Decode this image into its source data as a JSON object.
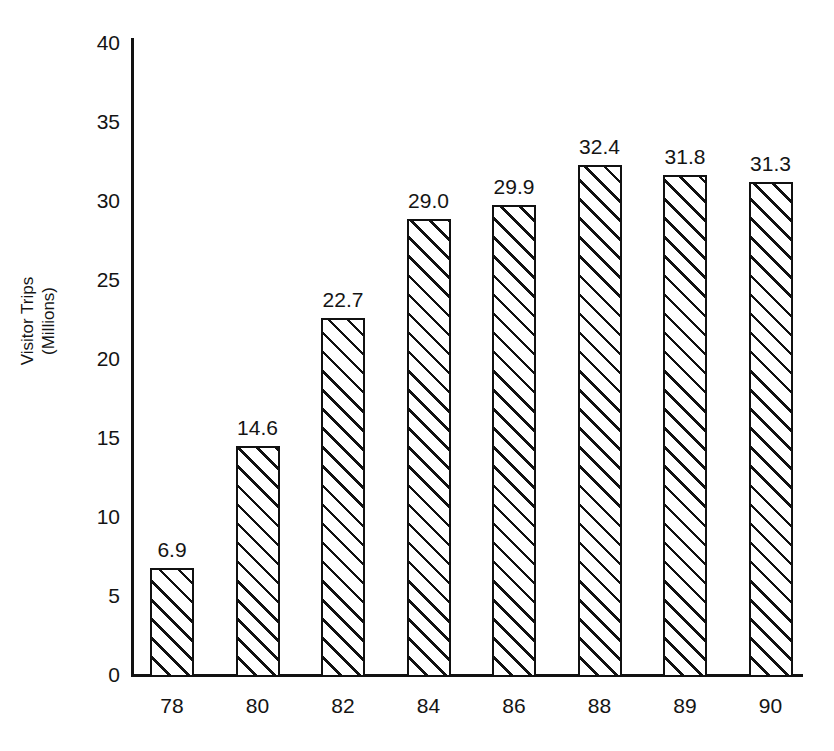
{
  "chart_data": {
    "type": "bar",
    "title": "",
    "title_note": "clipped at top edge of image, illegible",
    "xlabel": "",
    "ylabel_line1": "Visitor Trips",
    "ylabel_line2": "(Millions)",
    "ylabel": "Visitor Trips (Millions)",
    "categories": [
      "78",
      "80",
      "82",
      "84",
      "86",
      "88",
      "89",
      "90"
    ],
    "values": [
      6.9,
      14.6,
      22.7,
      29.0,
      29.9,
      32.4,
      31.8,
      31.3
    ],
    "data_labels": [
      "6.9",
      "14.6",
      "22.7",
      "29.0",
      "29.9",
      "32.4",
      "31.8",
      "31.3"
    ],
    "ylim": [
      0,
      40
    ],
    "yticks": [
      0,
      5,
      10,
      15,
      20,
      25,
      30,
      35,
      40
    ],
    "ytick_labels": [
      "0",
      "5",
      "10",
      "15",
      "20",
      "25",
      "30",
      "35",
      "40"
    ],
    "grid": false,
    "legend": null,
    "bar_fill": "diagonal-hatch",
    "colors": {
      "background": "#ffffff",
      "axis": "#111111",
      "bar_outline": "#111111",
      "bar_fill": "#ffffff",
      "hatch": "#111111",
      "text": "#141414"
    }
  }
}
